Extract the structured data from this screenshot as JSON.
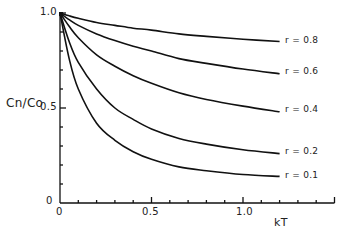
{
  "chart_data": {
    "type": "line",
    "title": "",
    "xlabel": "kT",
    "ylabel": "Cn/Co",
    "xlim": [
      0,
      1.5
    ],
    "ylim": [
      0,
      1.0
    ],
    "grid": false,
    "legend_position": "inline at line ends (right)",
    "x_ticks": [
      "0",
      "0.5",
      "1.0"
    ],
    "y_ticks": [
      "0",
      "0.5",
      "1.0"
    ],
    "x": [
      0,
      0.05,
      0.1,
      0.2,
      0.3,
      0.4,
      0.5,
      0.65,
      0.8,
      1.0,
      1.2
    ],
    "series": [
      {
        "name": "r = 0.8",
        "values": [
          1.0,
          0.985,
          0.972,
          0.95,
          0.935,
          0.92,
          0.91,
          0.89,
          0.877,
          0.862,
          0.85
        ]
      },
      {
        "name": "r = 0.6",
        "values": [
          1.0,
          0.965,
          0.935,
          0.89,
          0.855,
          0.825,
          0.8,
          0.76,
          0.735,
          0.705,
          0.68
        ]
      },
      {
        "name": "r = 0.4",
        "values": [
          1.0,
          0.93,
          0.87,
          0.78,
          0.72,
          0.67,
          0.63,
          0.58,
          0.545,
          0.51,
          0.48
        ]
      },
      {
        "name": "r = 0.2",
        "values": [
          1.0,
          0.85,
          0.74,
          0.6,
          0.5,
          0.44,
          0.39,
          0.34,
          0.31,
          0.28,
          0.26
        ]
      },
      {
        "name": "r = 0.1",
        "values": [
          1.0,
          0.76,
          0.6,
          0.42,
          0.33,
          0.27,
          0.23,
          0.19,
          0.17,
          0.15,
          0.14
        ]
      }
    ]
  },
  "labels": {
    "ylabel": "Cn/Co",
    "xlabel": "kT",
    "y_tick_1": "1.0",
    "y_tick_05": "0.5",
    "y_tick_0": "0",
    "x_tick_0": "0",
    "x_tick_05": "0.5",
    "x_tick_1": "1.0",
    "series_08": "r = 0.8",
    "series_06": "r = 0.6",
    "series_04": "r = 0.4",
    "series_02": "r = 0.2",
    "series_01": "r = 0.1"
  }
}
